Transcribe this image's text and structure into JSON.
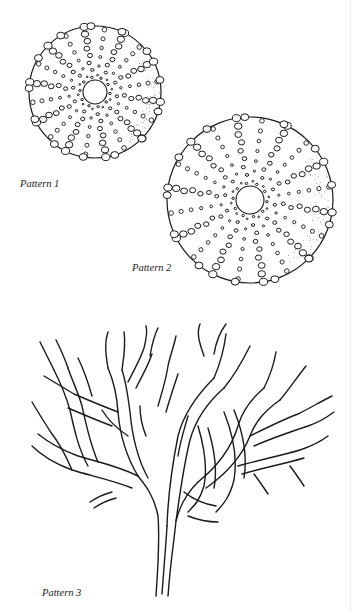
{
  "page": {
    "background": "#ffffff",
    "ink_color": "#1a1a1a"
  },
  "figures": [
    {
      "id": "pattern-1",
      "caption": "Pattern 1",
      "subject": "sea urchin test (top view), ten radiating rows of tubercles around a central opening"
    },
    {
      "id": "pattern-2",
      "caption": "Pattern 2",
      "subject": "sea urchin test (top view), larger, ten radiating rows of tubercles around a central opening"
    },
    {
      "id": "pattern-3",
      "caption": "Pattern 3",
      "subject": "branching coral / seaweed outline drawing"
    }
  ]
}
